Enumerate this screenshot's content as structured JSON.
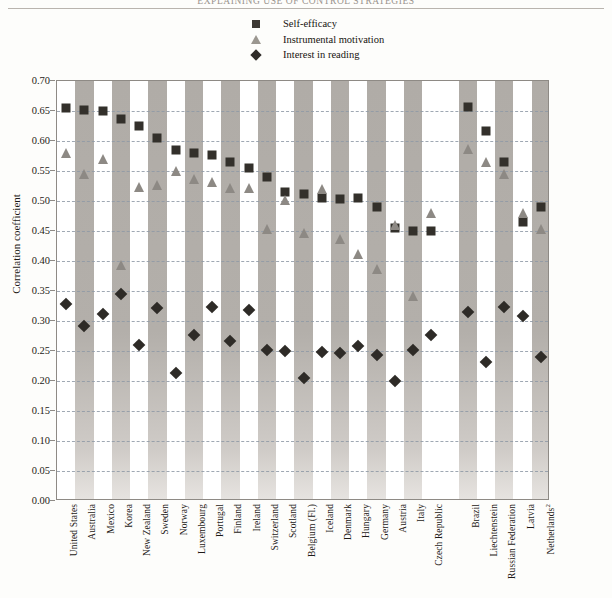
{
  "running_header": "EXPLAINING USE OF CONTROL STRATEGIES",
  "legend": {
    "items": [
      {
        "marker": "square-marker",
        "label": "Self-efficacy",
        "color": "#33302b"
      },
      {
        "marker": "triangle-marker",
        "label": "Instrumental motivation",
        "color": "#8d8984"
      },
      {
        "marker": "diamond-marker",
        "label": "Interest in reading",
        "color": "#2e2b27"
      }
    ]
  },
  "axes": {
    "y_label": "Correlation coefficient",
    "y_ticks": [
      "0.70",
      "0.65",
      "0.60",
      "0.55",
      "0.50",
      "0.45",
      "0.40",
      "0.35",
      "0.30",
      "0.25",
      "0.20",
      "0.15",
      "0.10",
      "0.05",
      "0.00"
    ]
  },
  "chart_data": {
    "type": "scatter",
    "title": "EXPLAINING USE OF CONTROL STRATEGIES",
    "xlabel": "",
    "ylabel": "Correlation coefficient",
    "ylim": [
      0.0,
      0.7
    ],
    "ytick_step": 0.05,
    "grid": true,
    "legend_position": "top-center",
    "categories": [
      "United States",
      "Australia",
      "Mexico",
      "Korea",
      "New Zealand",
      "Sweden",
      "Norway",
      "Luxembourg",
      "Portugal",
      "Finland",
      "Ireland",
      "Switzerland",
      "Scotland",
      "Belgium (Fl.)",
      "Iceland",
      "Denmark",
      "Hungary",
      "Germany",
      "Austria",
      "Italy",
      "Czech Republic",
      "Brazil",
      "Liechtenstein",
      "Russian Federation",
      "Latvia",
      "Netherlands²"
    ],
    "series": [
      {
        "name": "Self-efficacy",
        "marker": "square",
        "color": "#33302b",
        "values": [
          0.655,
          0.652,
          0.65,
          0.637,
          0.625,
          0.605,
          0.585,
          0.58,
          0.577,
          0.565,
          0.555,
          0.54,
          0.515,
          0.512,
          0.505,
          0.503,
          0.505,
          0.49,
          0.455,
          0.45,
          0.45,
          0.657,
          0.617,
          0.565,
          0.465,
          0.49
        ]
      },
      {
        "name": "Instrumental motivation",
        "marker": "triangle",
        "color": "#8d8984",
        "values": [
          0.578,
          0.543,
          0.568,
          0.392,
          0.522,
          0.525,
          0.548,
          0.535,
          0.53,
          0.52,
          0.52,
          0.452,
          0.5,
          0.445,
          0.518,
          0.435,
          0.41,
          0.385,
          0.458,
          0.34,
          0.478,
          0.585,
          0.563,
          0.543,
          0.478,
          0.452
        ]
      },
      {
        "name": "Interest in reading",
        "marker": "diamond",
        "color": "#2e2b27",
        "values": [
          0.328,
          0.292,
          0.312,
          0.345,
          0.26,
          0.322,
          0.213,
          0.277,
          0.323,
          0.267,
          0.318,
          0.252,
          0.25,
          0.205,
          0.248,
          0.247,
          0.258,
          0.243,
          0.2,
          0.252,
          0.277,
          0.315,
          0.232,
          0.323,
          0.308,
          0.24
        ]
      }
    ],
    "band_columns": [
      1,
      3,
      5,
      7,
      9,
      11,
      13,
      15,
      17,
      19,
      21,
      23,
      25
    ],
    "gap_after_index": 20
  }
}
